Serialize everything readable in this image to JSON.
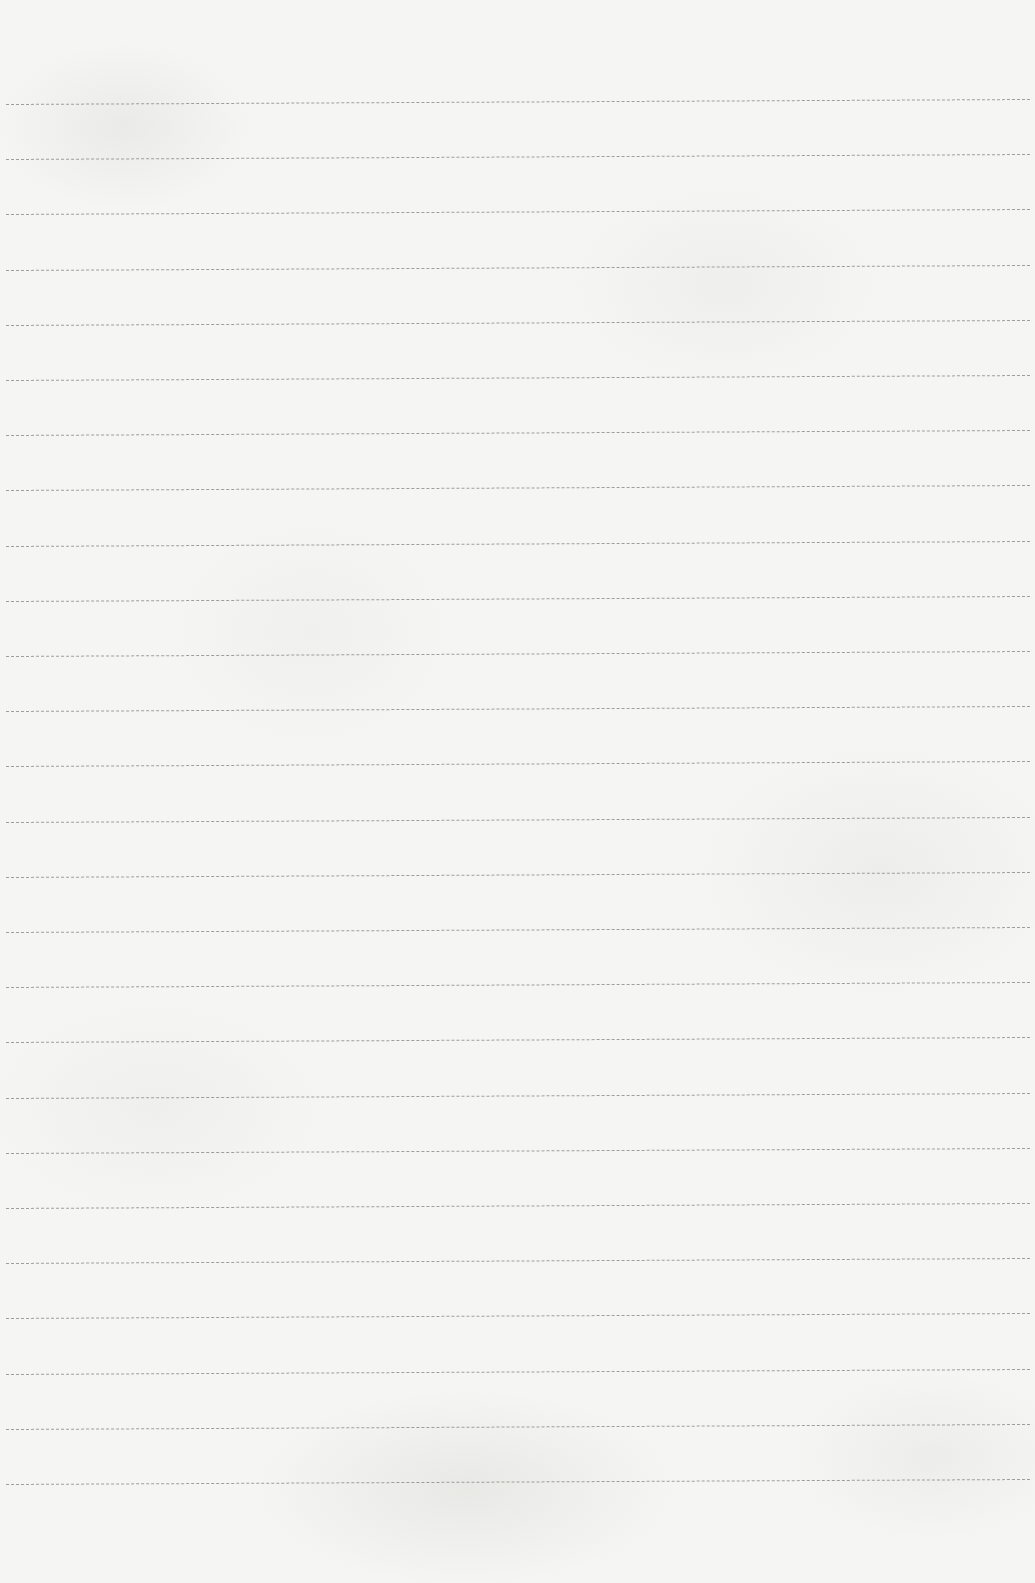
{
  "page": {
    "type": "blank-lined-paper",
    "line_count": 26,
    "first_line_y": 104,
    "line_spacing": 55.2,
    "colors": {
      "paper": "#f5f5f3",
      "rule": "#8f8f8c"
    }
  }
}
